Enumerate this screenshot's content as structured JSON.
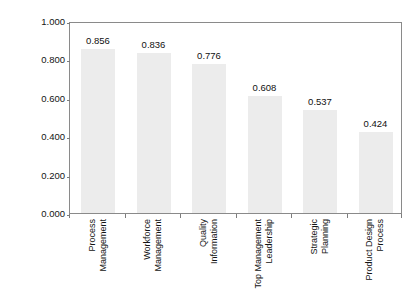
{
  "chart_data": {
    "type": "bar",
    "title": "",
    "xlabel": "",
    "ylabel": "Standardized coefficient",
    "ylim": [
      0.0,
      1.0
    ],
    "grid": false,
    "legend": "none",
    "y_ticks": [
      "0.000",
      "0.200",
      "0.400",
      "0.600",
      "0.800",
      "1.000"
    ],
    "y_tick_values": [
      0.0,
      0.2,
      0.4,
      0.6,
      0.8,
      1.0
    ],
    "categories": [
      "Process Management",
      "Workforce Management",
      "Quality Information",
      "Top Management Leadership",
      "Strategic Planning",
      "Product Design Process"
    ],
    "category_lines": [
      [
        "Process",
        "Management"
      ],
      [
        "Workforce",
        "Management"
      ],
      [
        "Quality",
        "Information"
      ],
      [
        "Top Management",
        "Leadership"
      ],
      [
        "Strategic",
        "Planning"
      ],
      [
        "Product Design",
        "Process"
      ]
    ],
    "values": [
      0.856,
      0.836,
      0.776,
      0.608,
      0.537,
      0.424
    ],
    "value_labels": [
      "0.856",
      "0.836",
      "0.776",
      "0.608",
      "0.537",
      "0.424"
    ],
    "colors": {
      "bar_fill": "#ececec",
      "frame": "#8a8a8a",
      "text": "#141414",
      "background": "#ffffff"
    }
  }
}
